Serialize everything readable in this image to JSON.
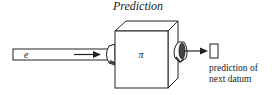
{
  "title": "Prediction",
  "input_label": "e",
  "box_label": "π",
  "output_label_line1": "prediction of",
  "output_label_line2": "next datum",
  "stroke_color": "#222222"
}
